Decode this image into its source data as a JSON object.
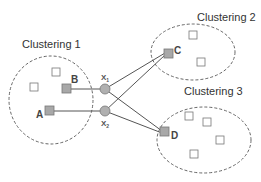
{
  "clusters": [
    {
      "title": "Clustering 1"
    },
    {
      "title": "Clustering 2"
    },
    {
      "title": "Clustering 3"
    }
  ],
  "nodes": {
    "A": "A",
    "B": "B",
    "C": "C",
    "D": "D"
  },
  "hubs": [
    {
      "label": "X",
      "sub": "1"
    },
    {
      "label": "X",
      "sub": "2"
    }
  ],
  "colors": {
    "node_fill": "#a8a8a8",
    "hub_fill": "#b0b0b0",
    "line": "#555555",
    "dash": "#666666"
  }
}
